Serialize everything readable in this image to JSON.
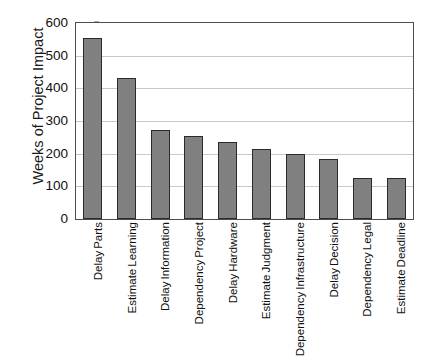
{
  "chart_data": {
    "type": "bar",
    "title": "",
    "xlabel": "",
    "ylabel": "Weeks of Project Impact",
    "ylim": [
      0,
      600
    ],
    "ytick_values": [
      600,
      500,
      400,
      300,
      200,
      100,
      0
    ],
    "ytick_labels": [
      "600",
      "500",
      "400",
      "300",
      "200",
      "100",
      "0"
    ],
    "grid": true,
    "legend": null,
    "bar_color": "#808080",
    "bar_edge_color": "#2b2b2b",
    "categories": [
      "Delay Parts",
      "Estimate Learning",
      "Delay Information",
      "Dependency Project",
      "Delay Hardware",
      "Estimate Judgment",
      "Dependency Infrastructure",
      "Delay Decision",
      "Dependency Legal",
      "Estimate Deadline"
    ],
    "category_lines": [
      [
        "Delay",
        "Parts"
      ],
      [
        "Estimate",
        "Learning"
      ],
      [
        "Delay",
        "Information"
      ],
      [
        "Dependency",
        "Project"
      ],
      [
        "Delay",
        "Hardware"
      ],
      [
        "Estimate",
        "Judgment"
      ],
      [
        "Dependency",
        "Infrastructure"
      ],
      [
        "Delay",
        "Decision"
      ],
      [
        "Dependency",
        "Legal"
      ],
      [
        "Estimate",
        "Deadline"
      ]
    ],
    "values": [
      555,
      432,
      272,
      255,
      237,
      213,
      198,
      185,
      125,
      125
    ]
  }
}
